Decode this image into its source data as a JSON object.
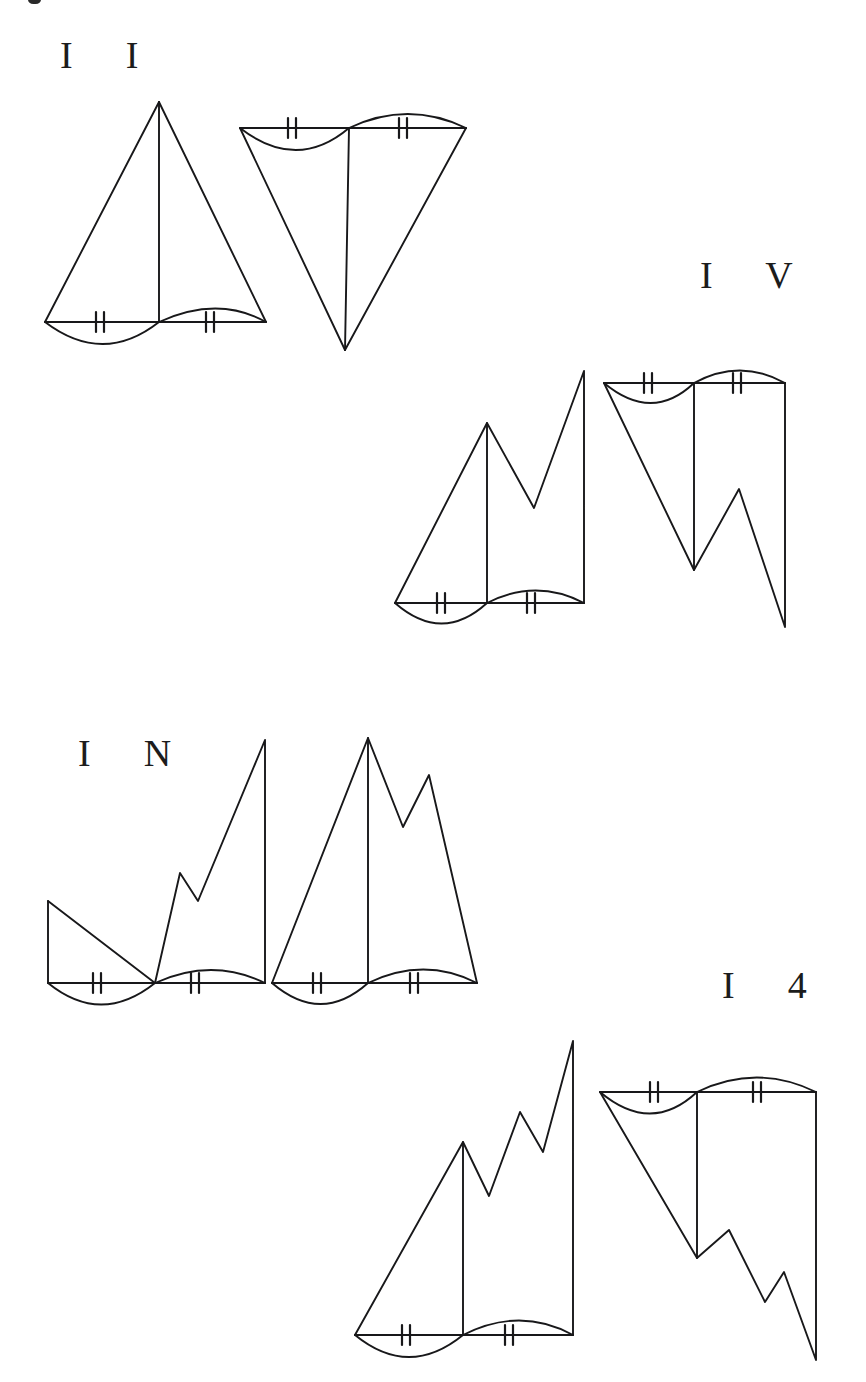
{
  "page": {
    "background_color": "#ffffff",
    "ink_color": "#18181a",
    "width": 866,
    "height": 1382,
    "artifact_note": "small black ink speck clipped at top edge"
  },
  "labels": [
    {
      "id": "label-1",
      "text": "I  I",
      "x": 60,
      "y": 36
    },
    {
      "id": "label-2",
      "text": "I  V",
      "x": 700,
      "y": 256
    },
    {
      "id": "label-3",
      "text": "I  N",
      "x": 78,
      "y": 734
    },
    {
      "id": "label-4",
      "text": "I  4",
      "x": 722,
      "y": 966
    }
  ],
  "figures": [
    {
      "id": "figure-1",
      "label": "I  I",
      "orientation_pair": [
        "upright",
        "inverted"
      ],
      "left": {
        "name": "upright-single-peak",
        "description": "Single tall triangle with vertical median; base split into two halves, left half bulges downward, right half bulges upward.",
        "base_y": 322,
        "base_x_left": 45,
        "base_x_mid": 135,
        "base_x_right": 266,
        "apex": [
          159,
          102
        ],
        "peaks": 1
      },
      "right": {
        "name": "inverted-single-peak",
        "description": "Inverted triangle hanging from a horizontal top line; vertical median drops to the bottom vertex; top-left arc sags, top-right arc bulges up.",
        "top_y": 128,
        "top_x_left": 240,
        "top_x_mid": 349,
        "top_x_right": 466,
        "vertex": [
          345,
          350
        ],
        "peaks": 1
      }
    },
    {
      "id": "figure-2",
      "label": "I  V",
      "orientation_pair": [
        "upright",
        "inverted"
      ],
      "left": {
        "name": "upright-double-peak",
        "description": "Zigzag profile with two peaks (second taller) over a split base; vertical median at first peak.",
        "base_y": 603,
        "base_x_left": 395,
        "base_x_mid": 487,
        "base_x_right": 584,
        "apex": [
          487,
          423
        ],
        "second_peak": [
          584,
          371
        ],
        "valley": [
          534,
          508
        ],
        "peaks": 2
      },
      "right": {
        "name": "inverted-double-peak",
        "description": "Inverted zigzag with two downward spikes (second longer) hanging from top line; vertical median drops to first spike.",
        "top_y": 383,
        "top_x_left": 604,
        "top_x_mid": 694,
        "top_x_right": 785,
        "vertex": [
          694,
          570
        ],
        "second_vertex": [
          785,
          627
        ],
        "valley": [
          739,
          489
        ],
        "peaks": 2
      }
    },
    {
      "id": "figure-3",
      "label": "I  N",
      "orientation_pair": [
        "upright",
        "upright"
      ],
      "left": {
        "name": "upright-descend-then-double-peak",
        "description": "Left portion descends from a raised left corner down to the base midpoint, then rises in a zigzag with two peaks; the median coincides with the base midpoint.",
        "base_y": 983,
        "base_x_left": 48,
        "base_x_mid": 155,
        "base_x_right": 265,
        "left_corner": [
          48,
          901
        ],
        "valley": [
          198,
          901
        ],
        "mid_peak": [
          180,
          873
        ],
        "apex": [
          265,
          740
        ],
        "peaks": 2
      },
      "right": {
        "name": "upright-double-peak-tall",
        "description": "Tall triangle with a secondary peak to the right of the main apex; vertical median under the apex; split base arcs.",
        "base_y": 983,
        "base_x_left": 272,
        "base_x_mid": 368,
        "base_x_right": 477,
        "apex": [
          368,
          738
        ],
        "second_peak": [
          429,
          775
        ],
        "valley": [
          403,
          827
        ],
        "peaks": 2
      }
    },
    {
      "id": "figure-4",
      "label": "I  4",
      "orientation_pair": [
        "upright",
        "inverted"
      ],
      "left": {
        "name": "upright-triple-peak-ascending",
        "description": "Ascending staircase zigzag with three peaks of increasing height; vertical median at the first peak; split base arcs.",
        "base_y": 1335,
        "base_x_left": 355,
        "base_x_mid": 463,
        "base_x_right": 573,
        "apex": [
          463,
          1142
        ],
        "peak_2": [
          520,
          1112
        ],
        "peak_3": [
          573,
          1041
        ],
        "valley_1": [
          489,
          1196
        ],
        "valley_2": [
          543,
          1152
        ],
        "peaks": 3
      },
      "right": {
        "name": "inverted-triple-peak-descending",
        "description": "Inverted descending zigzag with three downward spikes of increasing depth hanging from the top line; vertical median drops to the first spike.",
        "top_y": 1092,
        "top_x_left": 600,
        "top_x_mid": 697,
        "top_x_right": 816,
        "vertex": [
          697,
          1258
        ],
        "spike_2": [
          765,
          1302
        ],
        "spike_3": [
          816,
          1360
        ],
        "valley_1": [
          729,
          1230
        ],
        "valley_2": [
          784,
          1272
        ],
        "peaks": 3
      }
    }
  ],
  "annotations": {
    "tick_mark": {
      "name": "double-hash-congruence-tick",
      "count_per_segment": 2,
      "description": "Two short vertical strokes crossing a base/top segment to mark congruent lengths."
    },
    "arc_left": {
      "name": "sagging-arc",
      "description": "Arc below the segment, bulging downward (concave up)."
    },
    "arc_right": {
      "name": "bulging-arc",
      "description": "Arc above the segment, bulging upward (convex up)."
    },
    "total_tick_pairs": 16,
    "total_arcs": 16
  }
}
